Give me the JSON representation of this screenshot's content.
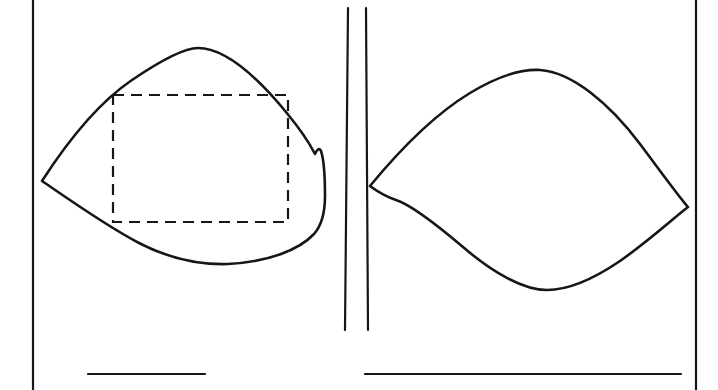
{
  "figure": {
    "canvas": {
      "width": 718,
      "height": 390,
      "background": "#ffffff"
    },
    "ink_color": "#16161a",
    "style": {
      "solid_stroke_width": 2.6,
      "thin_stroke_width": 2.2,
      "dashed_stroke_width": 2.2,
      "dash_pattern": "11 7"
    },
    "elements": [
      {
        "id": "left-frame-rule",
        "name": "left-vertical-rule",
        "kind": "line",
        "label": "Left vertical border rule",
        "x1": 33,
        "y1": 0,
        "x2": 33,
        "y2": 390
      },
      {
        "id": "right-frame-rule",
        "name": "right-vertical-rule",
        "kind": "line",
        "label": "Right vertical border rule",
        "x1": 696,
        "y1": 0,
        "x2": 696,
        "y2": 390
      },
      {
        "id": "center-rule-inner",
        "name": "center-vertical-rule-left",
        "kind": "line",
        "label": "Center double rule, left stroke",
        "x1": 348,
        "y1": 8,
        "x2": 345,
        "y2": 330
      },
      {
        "id": "center-rule-outer",
        "name": "center-vertical-rule-right",
        "kind": "line",
        "label": "Center double rule, right stroke",
        "x1": 366,
        "y1": 8,
        "x2": 368,
        "y2": 330
      },
      {
        "id": "left-leaf",
        "name": "left-leaf-curve",
        "kind": "path",
        "label": "Left leaf / lens outline with cusp at left tip and notch at right",
        "d": "M 42 181 C 62 150 95 105 132 80 C 163 59 184 48 198 48 C 226 48 258 78 286 112 C 300 129 310 144 315 154 C 317 150 319 147 321 151 C 324 160 325 178 325 196 C 325 212 322 225 314 234 C 299 250 268 262 228 264 C 197 265 168 258 139 243 C 108 227 74 203 42 181 Z"
      },
      {
        "id": "right-leaf",
        "name": "right-leaf-curve",
        "kind": "path",
        "label": "Right leaf / lens outline with cusp at left and point at right tip",
        "d": "M 370 186 C 398 152 432 116 470 93 C 500 75 524 69 540 70 C 572 72 610 104 640 144 C 664 176 680 198 688 207 C 676 216 650 240 620 261 C 592 280 566 290 547 290 C 523 290 492 272 463 247 C 437 225 412 205 396 200 C 387 197 378 192 370 186 Z"
      },
      {
        "id": "inscribed-rect",
        "name": "inscribed-dashed-rectangle",
        "kind": "rect",
        "label": "Dashed rectangle inscribed in the left leaf",
        "x": 113,
        "y": 95,
        "width": 175,
        "height": 127
      },
      {
        "id": "baseline-left",
        "name": "left-baseline-rule",
        "kind": "line",
        "label": "Lower horizontal rule, left panel",
        "x1": 88,
        "y1": 374,
        "x2": 205,
        "y2": 374
      },
      {
        "id": "baseline-right",
        "name": "right-baseline-rule",
        "kind": "line",
        "label": "Lower horizontal rule, right panel",
        "x1": 365,
        "y1": 374,
        "x2": 681,
        "y2": 374
      }
    ]
  }
}
